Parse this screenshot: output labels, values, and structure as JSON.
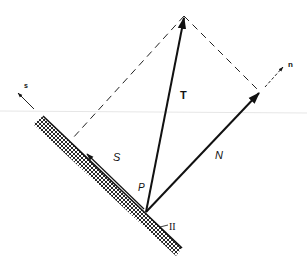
{
  "diagram": {
    "labels": {
      "traction": "T",
      "normal_component": "N",
      "shear_component": "S",
      "point": "P",
      "plane": "II",
      "normal_axis": "n",
      "shear_axis": "s"
    },
    "colors": {
      "ink": "#111111",
      "background": "#ffffff",
      "scan_line": "#e6e6e6"
    },
    "geometry": {
      "origin": [
        146,
        212
      ],
      "T_tip": [
        184,
        16
      ],
      "N_tip": [
        260,
        92
      ],
      "S_tip": [
        86,
        152
      ],
      "n_axis_start": [
        265,
        87
      ],
      "n_axis_tip": [
        284,
        66
      ],
      "s_axis_start": [
        34,
        109
      ],
      "s_axis_tip": [
        17,
        92
      ],
      "dashed_left_end": [
        72,
        139
      ],
      "surface_top": [
        43,
        116
      ],
      "surface_bottom": [
        182,
        248
      ]
    }
  }
}
